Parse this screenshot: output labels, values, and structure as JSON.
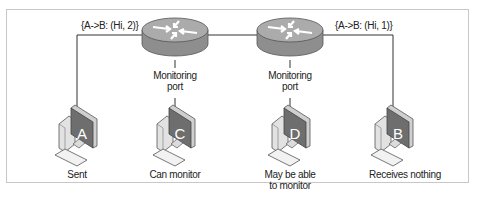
{
  "diagram": {
    "packets": [
      {
        "id": "left",
        "text": "{A->B: (Hi, 2)}"
      },
      {
        "id": "right",
        "text": "{A->B: (Hi, 1)}"
      }
    ],
    "routers": [
      {
        "id": "router-1",
        "port_label_line1": "Monitoring",
        "port_label_line2": "port"
      },
      {
        "id": "router-2",
        "port_label_line1": "Monitoring",
        "port_label_line2": "port"
      }
    ],
    "hosts": [
      {
        "id": "A",
        "letter": "A",
        "caption_line1": "Sent",
        "caption_line2": ""
      },
      {
        "id": "C",
        "letter": "C",
        "caption_line1": "Can monitor",
        "caption_line2": ""
      },
      {
        "id": "D",
        "letter": "D",
        "caption_line1": "May be able",
        "caption_line2": "to monitor"
      },
      {
        "id": "B",
        "letter": "B",
        "caption_line1": "Receives nothing",
        "caption_line2": ""
      }
    ],
    "colors": {
      "router_top": "#a9a9a9",
      "router_side": "#8f8f8f",
      "monitor_screen": "#6e6e6e",
      "line": "#333333",
      "frame": "#c8c8c8"
    }
  }
}
